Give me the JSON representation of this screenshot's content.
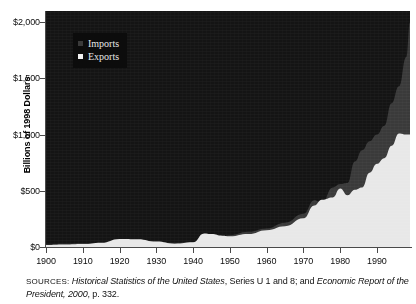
{
  "chart_data": {
    "type": "area",
    "title": "",
    "subtitle": "",
    "xlabel": "",
    "ylabel": "Billions of 1998 Dollars",
    "xlim": [
      1900,
      1999
    ],
    "ylim": [
      0,
      2100
    ],
    "grid": false,
    "stacked": false,
    "legend_position": "top-left-inside",
    "y_ticks": [
      {
        "value": 0,
        "label": "$0"
      },
      {
        "value": 500,
        "label": "$500"
      },
      {
        "value": 1000,
        "label": "$1,000"
      },
      {
        "value": 1500,
        "label": "$1,500"
      },
      {
        "value": 2000,
        "label": "$2,000"
      }
    ],
    "x_ticks": [
      {
        "value": 1900,
        "label": "1900"
      },
      {
        "value": 1910,
        "label": "1910"
      },
      {
        "value": 1920,
        "label": "1920"
      },
      {
        "value": 1930,
        "label": "1930"
      },
      {
        "value": 1940,
        "label": "1940"
      },
      {
        "value": 1950,
        "label": "1950"
      },
      {
        "value": 1960,
        "label": "1960"
      },
      {
        "value": 1970,
        "label": "1970"
      },
      {
        "value": 1980,
        "label": "1980"
      },
      {
        "value": 1990,
        "label": "1990"
      }
    ],
    "colors": {
      "plot_background": "#141414",
      "imports_fill": "#3a3a3a",
      "exports_fill": "#e8e8e8",
      "axis": "#4a4a4a",
      "text": "#0d0d0d"
    },
    "x": [
      1900,
      1905,
      1910,
      1915,
      1920,
      1925,
      1930,
      1935,
      1940,
      1943,
      1945,
      1948,
      1950,
      1955,
      1960,
      1965,
      1970,
      1973,
      1975,
      1978,
      1980,
      1982,
      1984,
      1986,
      1988,
      1990,
      1992,
      1994,
      1996,
      1998,
      1999
    ],
    "series": [
      {
        "name": "Imports",
        "marker": "small-gray-square",
        "color": "#3a3a3a",
        "values": [
          22,
          28,
          34,
          30,
          58,
          62,
          50,
          38,
          45,
          55,
          62,
          95,
          105,
          135,
          165,
          215,
          295,
          415,
          390,
          530,
          560,
          570,
          760,
          860,
          940,
          1000,
          1080,
          1280,
          1430,
          1690,
          2000
        ]
      },
      {
        "name": "Exports",
        "marker": "white-square",
        "color": "#e8e8e8",
        "values": [
          18,
          22,
          26,
          38,
          72,
          70,
          48,
          30,
          42,
          120,
          115,
          100,
          95,
          115,
          150,
          185,
          255,
          370,
          420,
          440,
          520,
          460,
          510,
          530,
          660,
          740,
          790,
          900,
          1010,
          1000,
          1000
        ]
      }
    ]
  },
  "legend": {
    "items": [
      {
        "label": "Imports",
        "swatch_color": "#3a3a3a"
      },
      {
        "label": "Exports",
        "swatch_color": "#f2f2f2"
      }
    ]
  },
  "axis": {
    "y_title": "Billions of 1998 Dollars"
  },
  "source": {
    "prefix": "SOURCES:",
    "work_1": "Historical Statistics of the United States",
    "middle": ", Series U 1 and 8; and ",
    "work_2": "Economic Report of the President, 2000",
    "suffix": ", p. 332."
  }
}
